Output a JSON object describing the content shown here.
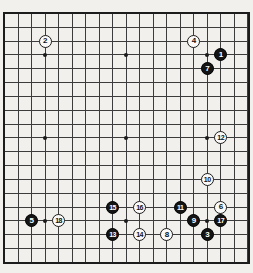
{
  "diagram": {
    "name": "go-fuseki-diagram",
    "board_size": 19,
    "background_color": "#f1f0ec",
    "grid_color": "#3c3c3c",
    "border_color": "#1c1c1c",
    "black_stone_color": "#141414",
    "white_stone_color": "#fbfaf8",
    "black_label_color": "#ffffff",
    "white_label_color": "#111111",
    "star_points": [
      {
        "col": 3,
        "row": 3
      },
      {
        "col": 9,
        "row": 3
      },
      {
        "col": 15,
        "row": 3
      },
      {
        "col": 3,
        "row": 9
      },
      {
        "col": 9,
        "row": 9
      },
      {
        "col": 15,
        "row": 9
      },
      {
        "col": 3,
        "row": 15
      },
      {
        "col": 9,
        "row": 15
      },
      {
        "col": 15,
        "row": 15
      }
    ],
    "stones": [
      {
        "move": "1",
        "color": "black",
        "col": 16,
        "row": 3
      },
      {
        "move": "2",
        "color": "white",
        "col": 3,
        "row": 2
      },
      {
        "move": "3",
        "color": "black",
        "col": 15,
        "row": 16
      },
      {
        "move": "4",
        "color": "white",
        "col": 14,
        "row": 2
      },
      {
        "move": "5",
        "color": "black",
        "col": 2,
        "row": 15
      },
      {
        "move": "6",
        "color": "white",
        "col": 16,
        "row": 14
      },
      {
        "move": "7",
        "color": "black",
        "col": 15,
        "row": 4
      },
      {
        "move": "8",
        "color": "white",
        "col": 12,
        "row": 16
      },
      {
        "move": "9",
        "color": "black",
        "col": 14,
        "row": 15
      },
      {
        "move": "10",
        "color": "white",
        "col": 15,
        "row": 12
      },
      {
        "move": "11",
        "color": "black",
        "col": 13,
        "row": 14
      },
      {
        "move": "12",
        "color": "white",
        "col": 16,
        "row": 9
      },
      {
        "move": "13",
        "color": "black",
        "col": 8,
        "row": 16
      },
      {
        "move": "14",
        "color": "white",
        "col": 10,
        "row": 16
      },
      {
        "move": "15",
        "color": "black",
        "col": 8,
        "row": 14
      },
      {
        "move": "16",
        "color": "white",
        "col": 10,
        "row": 14
      },
      {
        "move": "17",
        "color": "black",
        "col": 16,
        "row": 15
      },
      {
        "move": "18",
        "color": "white",
        "col": 4,
        "row": 15
      }
    ],
    "layout": {
      "board_left": 4.5,
      "board_top": 13.5,
      "cell_width": 13.514,
      "cell_height": 13.827
    }
  }
}
